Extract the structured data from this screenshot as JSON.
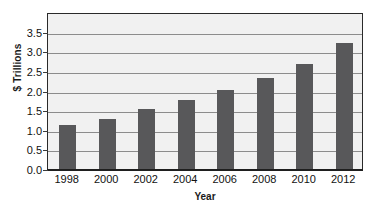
{
  "chart_data": {
    "type": "bar",
    "title": "",
    "subtitle": "",
    "xlabel": "Year",
    "ylabel": "$ Trillions",
    "categories": [
      "1998",
      "2000",
      "2002",
      "2004",
      "2006",
      "2008",
      "2010",
      "2012"
    ],
    "values": [
      1.12,
      1.28,
      1.52,
      1.76,
      2.02,
      2.32,
      2.67,
      3.22
    ],
    "series": [
      {
        "name": "",
        "values": [
          1.12,
          1.28,
          1.52,
          1.76,
          2.02,
          2.32,
          2.67,
          3.22
        ]
      }
    ],
    "ylim": [
      0.0,
      4.0
    ],
    "yticks": [
      "0.0",
      "0.5",
      "1.0",
      "1.5",
      "2.0",
      "2.5",
      "3.0",
      "3.5"
    ],
    "ytick_values": [
      0.0,
      0.5,
      1.0,
      1.5,
      2.0,
      2.5,
      3.0,
      3.5
    ],
    "grid": true,
    "grid_axis": "y",
    "legend": false,
    "legend_position": "none",
    "bar_color": "#58585a",
    "plot_background": "#f1f1f1",
    "gridline_color": "#8c8c8c",
    "axis_color": "#1f1f1f",
    "annotations": []
  }
}
